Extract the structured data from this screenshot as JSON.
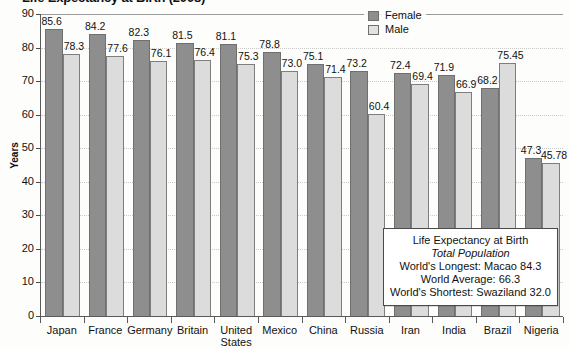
{
  "chart_data": {
    "type": "bar",
    "title": "Life Expectancy at Birth (2008)",
    "xlabel": "",
    "ylabel": "Years",
    "ylim": [
      0,
      90
    ],
    "ytick_step": 10,
    "yticks": [
      "90",
      "80",
      "70",
      "60",
      "50",
      "40",
      "30",
      "20",
      "10",
      "0"
    ],
    "grid": true,
    "legend_position": "top-right",
    "categories": [
      "Japan",
      "France",
      "Germany",
      "Britain",
      "United\nStates",
      "Mexico",
      "China",
      "Russia",
      "Iran",
      "India",
      "Brazil",
      "Nigeria"
    ],
    "series": [
      {
        "name": "Female",
        "color": "#8e8e8e",
        "values": [
          85.6,
          84.2,
          82.3,
          81.5,
          81.1,
          78.8,
          75.1,
          73.2,
          72.4,
          71.9,
          68.2,
          47.3
        ],
        "labels": [
          "85.6",
          "84.2",
          "82.3",
          "81.5",
          "81.1",
          "78.8",
          "75.1",
          "73.2",
          "72.4",
          "71.9",
          "68.2",
          "47.3"
        ]
      },
      {
        "name": "Male",
        "color": "#dcdcdc",
        "values": [
          78.3,
          77.6,
          76.1,
          76.4,
          75.3,
          73.0,
          71.4,
          60.4,
          69.4,
          66.9,
          75.45,
          45.78
        ],
        "labels": [
          "78.3",
          "77.6",
          "76.1",
          "76.4",
          "75.3",
          "73.0",
          "71.4",
          "60.4",
          "69.4",
          "66.9",
          "75.45",
          "45.78"
        ]
      }
    ]
  },
  "legend": {
    "items": [
      {
        "label": "Female",
        "swatch": "female"
      },
      {
        "label": "Male",
        "swatch": "male"
      }
    ]
  },
  "callout": {
    "line1": "Life Expectancy at Birth",
    "line2": "Total Population",
    "line3": "World's Longest: Macao 84.3",
    "line4": "World Average: 66.3",
    "line5": "World's Shortest: Swaziland 32.0"
  }
}
